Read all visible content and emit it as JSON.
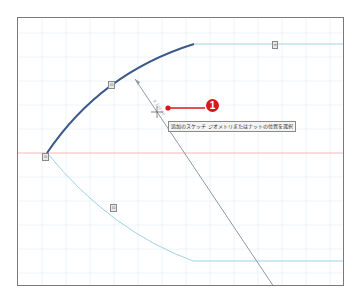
{
  "viewport": {
    "name": "sketch-canvas",
    "grid_spacing_px": 24
  },
  "colors": {
    "grid": "#eef3f7",
    "axis_red": "#f2b8b8",
    "selected_arc": "#3b5a8c",
    "construction_line": "#9fd3e6",
    "dimension_line": "#8e9aa6",
    "callout_red": "#d7191f",
    "frame": "#7a7a7a"
  },
  "tooltip": {
    "text": "追加のスケッチ ジオメトリまたはナットの位置を選択"
  },
  "callout": {
    "number": "1"
  },
  "dimension": {
    "label": "R 100.00"
  },
  "badges": [
    {
      "id": "arc-constraint",
      "text": "⊡"
    },
    {
      "id": "top-line-constraint",
      "text": "═"
    },
    {
      "id": "origin-constraint",
      "text": "⊙"
    },
    {
      "id": "lower-arc-constraint",
      "text": "⊡"
    }
  ]
}
